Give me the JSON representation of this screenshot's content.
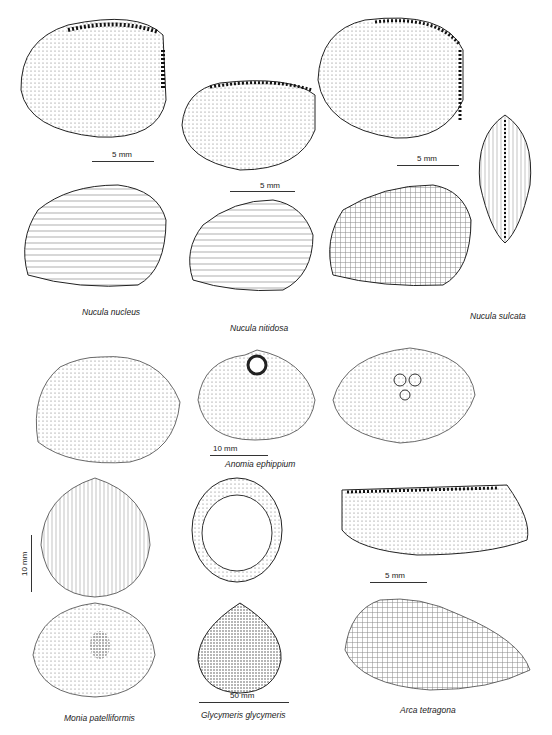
{
  "plate": {
    "species": [
      {
        "name": "Nucula nucleus"
      },
      {
        "name": "Nucula nitidosa"
      },
      {
        "name": "Nucula sulcata"
      },
      {
        "name": "Anomia ephippium"
      },
      {
        "name": "Monia patelliformis"
      },
      {
        "name": "Glycymeris glycymeris"
      },
      {
        "name": "Arca tetragona"
      }
    ],
    "scales": [
      {
        "label": "5 mm"
      },
      {
        "label": "5 mm"
      },
      {
        "label": "5 mm"
      },
      {
        "label": "10 mm"
      },
      {
        "label": "10 mm"
      },
      {
        "label": "5 mm"
      },
      {
        "label": "50 mm"
      }
    ]
  }
}
